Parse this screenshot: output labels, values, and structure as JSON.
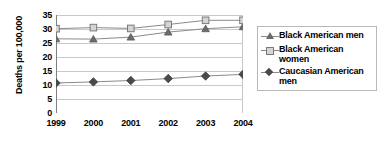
{
  "chart_data": {
    "type": "line",
    "title": "",
    "xlabel": "",
    "ylabel": "Deaths per 100,000",
    "categories": [
      "1999",
      "2000",
      "2001",
      "2002",
      "2003",
      "2004"
    ],
    "ylim": [
      0,
      35
    ],
    "yticks": [
      0,
      5,
      10,
      15,
      20,
      25,
      30,
      35
    ],
    "grid": true,
    "legend_position": "right",
    "series": [
      {
        "name": "Black American men",
        "marker": "triangle",
        "color": "#6b6b6b",
        "values": [
          26.5,
          26.4,
          27.1,
          28.9,
          30.1,
          30.8
        ]
      },
      {
        "name": "Black American women",
        "marker": "square",
        "color": "#d4d4d4",
        "values": [
          30.1,
          30.5,
          30.2,
          31.6,
          33.1,
          33.1
        ]
      },
      {
        "name": "Caucasian American men",
        "marker": "diamond",
        "color": "#4a4a4a",
        "values": [
          10.7,
          11.1,
          11.6,
          12.3,
          13.2,
          13.8
        ]
      }
    ]
  },
  "axis": {
    "y_title": "Deaths per 100,000",
    "y_tick_labels": [
      "35",
      "30",
      "25",
      "20",
      "15",
      "10",
      "5",
      "0"
    ],
    "x_tick_labels": [
      "1999",
      "2000",
      "2001",
      "2002",
      "2003",
      "2004"
    ]
  },
  "legend": {
    "entries": [
      {
        "label": "Black American men",
        "marker": "triangle-marker"
      },
      {
        "label": "Black American women",
        "marker": "square-marker"
      },
      {
        "label": "Caucasian American men",
        "marker": "diamond-marker"
      }
    ]
  },
  "colors": {
    "grid": "#c9c9c9",
    "axis": "#808080",
    "series_triangle": "#6b6b6b",
    "series_square": "#d4d4d4",
    "series_diamond": "#4a4a4a",
    "legend_border": "#b8b8b8",
    "text": "#000000"
  }
}
